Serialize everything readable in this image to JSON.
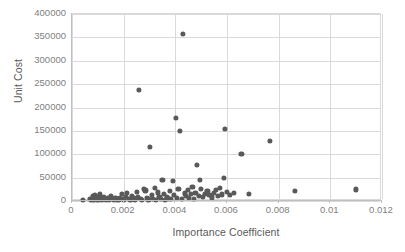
{
  "chart_data": {
    "type": "scatter",
    "title": "",
    "xlabel": "Importance Coefficient",
    "ylabel": "Unit Cost",
    "xlim": [
      0,
      0.012
    ],
    "ylim": [
      0,
      400000
    ],
    "xticks": [
      "0",
      "0.002",
      "0.004",
      "0.006",
      "0.008",
      "0.01",
      "0.012"
    ],
    "xtick_values": [
      0,
      0.002,
      0.004,
      0.006,
      0.008,
      0.01,
      0.012
    ],
    "yticks": [
      "0",
      "50000",
      "100000",
      "150000",
      "200000",
      "250000",
      "300000",
      "350000",
      "400000"
    ],
    "ytick_values": [
      0,
      50000,
      100000,
      150000,
      200000,
      250000,
      300000,
      350000,
      400000
    ],
    "grid": true,
    "legend": false,
    "marker_color": "#595959",
    "gridline_color": "#d9d9d9",
    "axis_text_color": "#808080",
    "title_text_color": "#595959",
    "series": [
      {
        "name": "Items",
        "points": [
          [
            0.00043,
            1800
          ],
          [
            0.0007,
            5200
          ],
          [
            0.00074,
            2200
          ],
          [
            0.0008,
            9800
          ],
          [
            0.00083,
            3100
          ],
          [
            0.00088,
            13500
          ],
          [
            0.00092,
            4200
          ],
          [
            0.00096,
            2600
          ],
          [
            0.001,
            8800
          ],
          [
            0.00104,
            3400
          ],
          [
            0.00108,
            14200
          ],
          [
            0.00112,
            5600
          ],
          [
            0.00116,
            2100
          ],
          [
            0.00122,
            9200
          ],
          [
            0.00126,
            3800
          ],
          [
            0.00132,
            2400
          ],
          [
            0.00138,
            6100
          ],
          [
            0.00144,
            3200
          ],
          [
            0.0015,
            11500
          ],
          [
            0.00156,
            4400
          ],
          [
            0.00162,
            2800
          ],
          [
            0.00168,
            7400
          ],
          [
            0.00174,
            3600
          ],
          [
            0.0018,
            2200
          ],
          [
            0.00186,
            5800
          ],
          [
            0.00192,
            15200
          ],
          [
            0.00196,
            3900
          ],
          [
            0.00202,
            2500
          ],
          [
            0.00208,
            8600
          ],
          [
            0.00214,
            17800
          ],
          [
            0.0022,
            4600
          ],
          [
            0.00226,
            2900
          ],
          [
            0.00232,
            11200
          ],
          [
            0.00238,
            5400
          ],
          [
            0.00244,
            3300
          ],
          [
            0.0025,
            19600
          ],
          [
            0.00256,
            7800
          ],
          [
            0.0026,
            237000
          ],
          [
            0.00266,
            4100
          ],
          [
            0.00272,
            2700
          ],
          [
            0.00278,
            26400
          ],
          [
            0.00284,
            22500
          ],
          [
            0.0029,
            6200
          ],
          [
            0.00296,
            3500
          ],
          [
            0.00302,
            116000
          ],
          [
            0.00308,
            12800
          ],
          [
            0.00314,
            5100
          ],
          [
            0.0032,
            27200
          ],
          [
            0.00326,
            3000
          ],
          [
            0.00332,
            18400
          ],
          [
            0.00338,
            8200
          ],
          [
            0.00344,
            4300
          ],
          [
            0.0035,
            45500
          ],
          [
            0.00356,
            14600
          ],
          [
            0.0036,
            2600
          ],
          [
            0.00366,
            9400
          ],
          [
            0.00372,
            5700
          ],
          [
            0.00378,
            21800
          ],
          [
            0.00384,
            3700
          ],
          [
            0.0039,
            43200
          ],
          [
            0.00396,
            12200
          ],
          [
            0.00402,
            177000
          ],
          [
            0.00406,
            6800
          ],
          [
            0.00412,
            25100
          ],
          [
            0.00418,
            149500
          ],
          [
            0.00424,
            4900
          ],
          [
            0.0043,
            358000
          ],
          [
            0.00436,
            16200
          ],
          [
            0.00442,
            10400
          ],
          [
            0.00448,
            23600
          ],
          [
            0.00454,
            7100
          ],
          [
            0.0046,
            14900
          ],
          [
            0.00466,
            29300
          ],
          [
            0.00472,
            5300
          ],
          [
            0.00478,
            18100
          ],
          [
            0.00484,
            78000
          ],
          [
            0.0049,
            11600
          ],
          [
            0.00494,
            44800
          ],
          [
            0.005,
            26700
          ],
          [
            0.00508,
            8900
          ],
          [
            0.00516,
            15400
          ],
          [
            0.00524,
            22300
          ],
          [
            0.00532,
            13100
          ],
          [
            0.0054,
            7600
          ],
          [
            0.00548,
            16800
          ],
          [
            0.00556,
            24200
          ],
          [
            0.00564,
            10200
          ],
          [
            0.00572,
            27600
          ],
          [
            0.0058,
            14100
          ],
          [
            0.00588,
            48800
          ],
          [
            0.00592,
            153500
          ],
          [
            0.006,
            19300
          ],
          [
            0.00612,
            12400
          ],
          [
            0.00628,
            16500
          ],
          [
            0.00656,
            101000
          ],
          [
            0.00684,
            16000
          ],
          [
            0.00766,
            129000
          ],
          [
            0.00862,
            21000
          ],
          [
            0.01098,
            25000
          ]
        ]
      }
    ]
  }
}
